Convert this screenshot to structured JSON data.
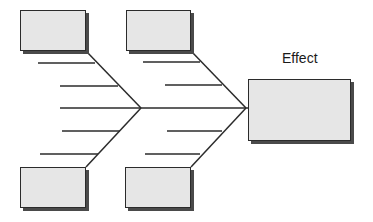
{
  "diagram": {
    "type": "fishbone",
    "effect": {
      "label": "Effect",
      "label_pos": {
        "x": 282,
        "y": 50
      },
      "box": {
        "x": 248,
        "y": 79,
        "w": 103,
        "h": 62
      }
    },
    "causes": [
      {
        "id": "cause-top-left",
        "label": "",
        "box": {
          "x": 20,
          "y": 10,
          "w": 66,
          "h": 41
        }
      },
      {
        "id": "cause-top-middle",
        "label": "",
        "box": {
          "x": 126,
          "y": 10,
          "w": 65,
          "h": 41
        }
      },
      {
        "id": "cause-bottom-left",
        "label": "",
        "box": {
          "x": 20,
          "y": 167,
          "w": 66,
          "h": 41
        }
      },
      {
        "id": "cause-bottom-middle",
        "label": "",
        "box": {
          "x": 125,
          "y": 167,
          "w": 66,
          "h": 41
        }
      }
    ],
    "spine": {
      "x1": 60,
      "y1": 108,
      "x2": 248,
      "y2": 108
    },
    "bones": [
      {
        "x1": 86,
        "y1": 51,
        "x2": 141,
        "y2": 108
      },
      {
        "x1": 141,
        "y1": 108,
        "x2": 86,
        "y2": 167
      },
      {
        "x1": 191,
        "y1": 51,
        "x2": 246,
        "y2": 108
      },
      {
        "x1": 246,
        "y1": 108,
        "x2": 191,
        "y2": 167
      }
    ],
    "ribs": [
      {
        "x1": 38,
        "y1": 63,
        "x2": 95,
        "y2": 63
      },
      {
        "x1": 60,
        "y1": 86,
        "x2": 118,
        "y2": 86
      },
      {
        "x1": 62,
        "y1": 131,
        "x2": 120,
        "y2": 131
      },
      {
        "x1": 40,
        "y1": 154,
        "x2": 98,
        "y2": 154
      },
      {
        "x1": 143,
        "y1": 62,
        "x2": 200,
        "y2": 62
      },
      {
        "x1": 165,
        "y1": 85,
        "x2": 222,
        "y2": 85
      },
      {
        "x1": 167,
        "y1": 131,
        "x2": 222,
        "y2": 131
      },
      {
        "x1": 145,
        "y1": 154,
        "x2": 200,
        "y2": 154
      }
    ],
    "colors": {
      "line": "#2b2b2b",
      "box_fill": "#e6e6e6",
      "box_border": "#2b2b2b",
      "shadow": "#4a4a4a",
      "background": "#ffffff"
    }
  }
}
